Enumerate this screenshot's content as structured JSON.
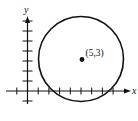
{
  "diagram": {
    "type": "coordinate-plane-circle",
    "x_axis_label": "x",
    "y_axis_label": "y",
    "center": {
      "x": 5,
      "y": 3
    },
    "center_label": "(5,3)",
    "x_ticks": [
      -1,
      1,
      2,
      3,
      4,
      5,
      6,
      7,
      8
    ],
    "y_ticks": [
      -1,
      1,
      2,
      3,
      4,
      5,
      6,
      7
    ],
    "circle_passes_near": "x-axis between 2 and 8",
    "colors": {
      "ink": "#111111",
      "background": "#ffffff"
    }
  }
}
